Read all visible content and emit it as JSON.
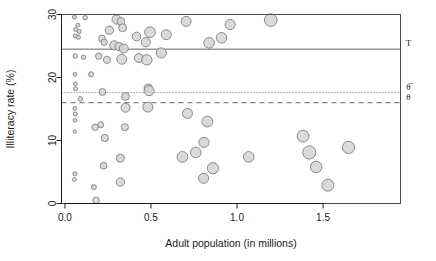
{
  "chart_data": {
    "type": "scatter",
    "title": "",
    "xlabel": "Adult population  (in millions)",
    "ylabel": "Illiteracy rate  (%)",
    "xlim": [
      -0.02,
      1.95
    ],
    "ylim": [
      0,
      30
    ],
    "xticks": [
      0.0,
      0.5,
      1.0,
      1.5
    ],
    "xticklabels": [
      "0.0",
      "0.5",
      "1.0",
      "1.5"
    ],
    "yticks": [
      0,
      10,
      20,
      30
    ],
    "yticklabels": [
      "0",
      "10",
      "20",
      "30"
    ],
    "grid": false,
    "legend": null,
    "marker": {
      "shape": "circle",
      "fill": "#d4d4d4",
      "stroke": "#808080",
      "size_encodes": "adult population (bubble area)"
    },
    "reference_lines": [
      {
        "name": "tau-line",
        "label": "T",
        "y": 24.5,
        "style": "solid",
        "color": "#666666"
      },
      {
        "name": "theta-bar-line",
        "label": "θ̅",
        "y": 17.6,
        "style": "dotted",
        "color": "#666666"
      },
      {
        "name": "theta-line",
        "label": "θ",
        "y": 16.0,
        "style": "dashed",
        "color": "#666666"
      }
    ],
    "points": [
      {
        "x": 0.055,
        "y": 29.6,
        "r": 2.0
      },
      {
        "x": 0.075,
        "y": 28.3,
        "r": 2.0
      },
      {
        "x": 0.062,
        "y": 27.6,
        "r": 1.9
      },
      {
        "x": 0.083,
        "y": 27.3,
        "r": 2.1
      },
      {
        "x": 0.06,
        "y": 26.6,
        "r": 2.0
      },
      {
        "x": 0.078,
        "y": 26.4,
        "r": 2.1
      },
      {
        "x": 0.118,
        "y": 29.5,
        "r": 2.2
      },
      {
        "x": 0.06,
        "y": 23.4,
        "r": 2.2
      },
      {
        "x": 0.108,
        "y": 23.2,
        "r": 2.2
      },
      {
        "x": 0.058,
        "y": 20.5,
        "r": 1.8
      },
      {
        "x": 0.152,
        "y": 20.5,
        "r": 2.6
      },
      {
        "x": 0.06,
        "y": 19.0,
        "r": 1.9
      },
      {
        "x": 0.062,
        "y": 18.2,
        "r": 2.0
      },
      {
        "x": 0.09,
        "y": 16.6,
        "r": 2.3
      },
      {
        "x": 0.058,
        "y": 15.1,
        "r": 1.9
      },
      {
        "x": 0.06,
        "y": 14.2,
        "r": 2.0
      },
      {
        "x": 0.058,
        "y": 13.2,
        "r": 1.8
      },
      {
        "x": 0.057,
        "y": 11.4,
        "r": 1.7
      },
      {
        "x": 0.058,
        "y": 4.7,
        "r": 2.1
      },
      {
        "x": 0.055,
        "y": 3.8,
        "r": 1.9
      },
      {
        "x": 0.215,
        "y": 26.2,
        "r": 3.4
      },
      {
        "x": 0.228,
        "y": 25.6,
        "r": 3.2
      },
      {
        "x": 0.196,
        "y": 23.4,
        "r": 3.2
      },
      {
        "x": 0.244,
        "y": 22.8,
        "r": 3.6
      },
      {
        "x": 0.258,
        "y": 27.5,
        "r": 4.2
      },
      {
        "x": 0.218,
        "y": 17.7,
        "r": 3.4
      },
      {
        "x": 0.175,
        "y": 12.1,
        "r": 3.2
      },
      {
        "x": 0.208,
        "y": 12.5,
        "r": 3.0
      },
      {
        "x": 0.232,
        "y": 10.4,
        "r": 3.6
      },
      {
        "x": 0.225,
        "y": 6.0,
        "r": 3.4
      },
      {
        "x": 0.168,
        "y": 2.6,
        "r": 2.5
      },
      {
        "x": 0.181,
        "y": 0.5,
        "r": 3.3
      },
      {
        "x": 0.3,
        "y": 29.2,
        "r": 4.6
      },
      {
        "x": 0.325,
        "y": 28.9,
        "r": 3.9
      },
      {
        "x": 0.335,
        "y": 27.9,
        "r": 4.0
      },
      {
        "x": 0.287,
        "y": 25.1,
        "r": 4.6
      },
      {
        "x": 0.315,
        "y": 24.9,
        "r": 4.2
      },
      {
        "x": 0.342,
        "y": 24.6,
        "r": 4.5
      },
      {
        "x": 0.33,
        "y": 22.9,
        "r": 5.0
      },
      {
        "x": 0.352,
        "y": 17.0,
        "r": 3.9
      },
      {
        "x": 0.352,
        "y": 15.2,
        "r": 4.5
      },
      {
        "x": 0.348,
        "y": 12.1,
        "r": 3.6
      },
      {
        "x": 0.322,
        "y": 7.2,
        "r": 4.0
      },
      {
        "x": 0.322,
        "y": 3.4,
        "r": 4.2
      },
      {
        "x": 0.416,
        "y": 26.5,
        "r": 4.4
      },
      {
        "x": 0.43,
        "y": 23.1,
        "r": 4.5
      },
      {
        "x": 0.47,
        "y": 25.6,
        "r": 4.6
      },
      {
        "x": 0.494,
        "y": 27.2,
        "r": 5.4
      },
      {
        "x": 0.476,
        "y": 22.8,
        "r": 5.2
      },
      {
        "x": 0.484,
        "y": 18.3,
        "r": 4.1
      },
      {
        "x": 0.489,
        "y": 17.9,
        "r": 5.0
      },
      {
        "x": 0.482,
        "y": 15.3,
        "r": 5.0
      },
      {
        "x": 0.56,
        "y": 23.9,
        "r": 5.1
      },
      {
        "x": 0.589,
        "y": 26.8,
        "r": 5.0
      },
      {
        "x": 0.704,
        "y": 28.9,
        "r": 5.0
      },
      {
        "x": 0.838,
        "y": 25.5,
        "r": 5.3
      },
      {
        "x": 0.91,
        "y": 26.3,
        "r": 5.3
      },
      {
        "x": 0.96,
        "y": 28.4,
        "r": 5.1
      },
      {
        "x": 1.196,
        "y": 29.1,
        "r": 6.3
      },
      {
        "x": 0.712,
        "y": 14.3,
        "r": 5.0
      },
      {
        "x": 0.828,
        "y": 13.0,
        "r": 5.4
      },
      {
        "x": 0.683,
        "y": 7.4,
        "r": 5.4
      },
      {
        "x": 0.76,
        "y": 8.1,
        "r": 5.3
      },
      {
        "x": 0.808,
        "y": 9.7,
        "r": 5.1
      },
      {
        "x": 0.806,
        "y": 4.0,
        "r": 5.0
      },
      {
        "x": 0.86,
        "y": 5.6,
        "r": 5.6
      },
      {
        "x": 1.068,
        "y": 7.4,
        "r": 5.3
      },
      {
        "x": 1.384,
        "y": 10.7,
        "r": 5.9
      },
      {
        "x": 1.42,
        "y": 8.1,
        "r": 6.6
      },
      {
        "x": 1.46,
        "y": 5.8,
        "r": 5.8
      },
      {
        "x": 1.528,
        "y": 2.9,
        "r": 6.0
      },
      {
        "x": 1.648,
        "y": 8.9,
        "r": 6.1
      }
    ]
  },
  "axes": {
    "x_title": "Adult population  (in millions)",
    "y_title": "Illiteracy rate  (%)"
  },
  "annotations": {
    "tau": "T",
    "theta_bar": "θ̅",
    "theta": "θ"
  }
}
